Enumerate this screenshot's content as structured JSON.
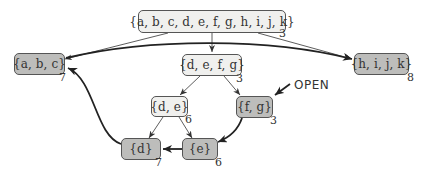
{
  "diagram": {
    "nodes": [
      {
        "id": "root",
        "label": "{a, b, c, d, e, f, g, h, i, j, k}",
        "value": "3",
        "style": "light"
      },
      {
        "id": "abc",
        "label": "{a, b, c}",
        "value": "7",
        "style": "dark"
      },
      {
        "id": "defg",
        "label": "{d, e, f, g}",
        "value": "3",
        "style": "light"
      },
      {
        "id": "hijk",
        "label": "{h, i, j, k}",
        "value": "8",
        "style": "dark"
      },
      {
        "id": "de",
        "label": "{d, e}",
        "value": "6",
        "style": "light"
      },
      {
        "id": "fg",
        "label": "{f, g}",
        "value": "3",
        "style": "dark"
      },
      {
        "id": "d",
        "label": "{d}",
        "value": "7",
        "style": "dark"
      },
      {
        "id": "e",
        "label": "{e}",
        "value": "6",
        "style": "dark"
      }
    ],
    "edges": [
      {
        "from": "root",
        "to": "abc",
        "weight": "thin"
      },
      {
        "from": "root",
        "to": "defg",
        "weight": "thin"
      },
      {
        "from": "root",
        "to": "hijk",
        "weight": "thin"
      },
      {
        "from": "defg",
        "to": "de",
        "weight": "thin"
      },
      {
        "from": "defg",
        "to": "fg",
        "weight": "thin"
      },
      {
        "from": "de",
        "to": "d",
        "weight": "thin"
      },
      {
        "from": "de",
        "to": "e",
        "weight": "thin"
      },
      {
        "from": "fg",
        "to": "e",
        "weight": "thick"
      },
      {
        "from": "e",
        "to": "d",
        "weight": "thick"
      },
      {
        "from": "d",
        "to": "abc",
        "weight": "thick"
      },
      {
        "from": "abc",
        "to": "hijk",
        "weight": "thick"
      }
    ],
    "annotation": {
      "label": "OPEN",
      "points_to": "fg"
    },
    "colors": {
      "light_fill": "#f0f0ee",
      "dark_fill": "#bdbdbb",
      "stroke": "#333333"
    }
  }
}
